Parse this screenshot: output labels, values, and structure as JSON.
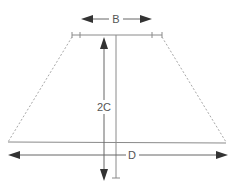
{
  "diagram": {
    "type": "lampshade-dimensions",
    "labels": {
      "top_width": "B",
      "height": "2C",
      "bottom_width": "D"
    },
    "colors": {
      "line": "#8a8a8a",
      "arrow": "#333333",
      "dashed": "#a8a8a8",
      "text": "#555555"
    }
  }
}
